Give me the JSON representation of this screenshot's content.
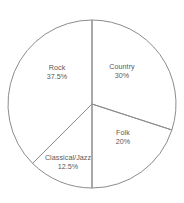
{
  "chart_data": {
    "type": "pie",
    "title": "",
    "subtitle": "",
    "xlabel": "",
    "ylabel": "",
    "grid": false,
    "legend": "none",
    "labels_inside_slices": true,
    "start_angle_deg": 90,
    "direction": "clockwise",
    "categories": [
      "Country",
      "Folk",
      "Classical/Jazz",
      "Rock"
    ],
    "values": [
      30,
      20,
      12.5,
      37.5
    ],
    "value_unit": "%",
    "slices": [
      {
        "name": "Country",
        "value": 30,
        "value_label": "30%",
        "angle_deg": 108,
        "start_deg": 0,
        "end_deg": 108,
        "fill": "#ffffff",
        "stroke": "#8c8c8c",
        "label_x": 122,
        "label_y": 72
      },
      {
        "name": "Folk",
        "value": 20,
        "value_label": "20%",
        "angle_deg": 72,
        "start_deg": 108,
        "end_deg": 180,
        "fill": "#ffffff",
        "stroke": "#8c8c8c",
        "label_x": 123,
        "label_y": 138
      },
      {
        "name": "Classical/Jazz",
        "value": 12.5,
        "value_label": "12.5%",
        "angle_deg": 45,
        "start_deg": 180,
        "end_deg": 225,
        "fill": "#ffffff",
        "stroke": "#8c8c8c",
        "label_x": 68,
        "label_y": 163
      },
      {
        "name": "Rock",
        "value": 37.5,
        "value_label": "37.5%",
        "angle_deg": 135,
        "start_deg": 225,
        "end_deg": 360,
        "fill": "#ffffff",
        "stroke": "#8c8c8c",
        "label_x": 57,
        "label_y": 73
      }
    ],
    "geometry": {
      "center_x": 92,
      "center_y": 104,
      "radius": 84
    },
    "colors": {
      "background": "#ffffff",
      "outline": "#8c8c8c",
      "label_text": "#5a5a5a"
    }
  }
}
